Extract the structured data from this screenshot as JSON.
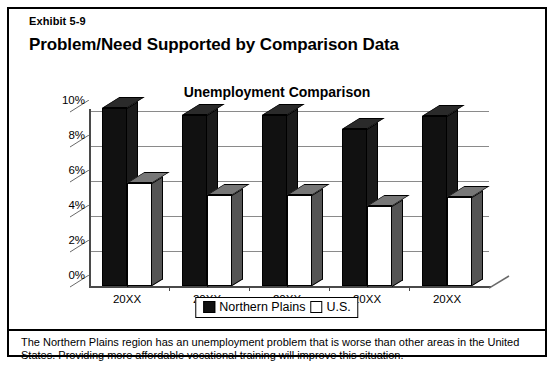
{
  "exhibit": {
    "label": "Exhibit 5-9"
  },
  "heading": {
    "title": "Problem/Need Supported by Comparison Data"
  },
  "legend": {
    "northern_plains": "Northern Plains",
    "us": "U.S."
  },
  "footer": {
    "text": "The Northern Plains region has an unemployment problem that is worse than other areas in the United States. Providing more affordable vocational training will improve this situation."
  },
  "chart_data": {
    "type": "bar",
    "title": "Unemployment Comparison",
    "xlabel": "",
    "ylabel": "",
    "ylim": [
      0,
      10
    ],
    "ytick_labels": [
      "10%",
      "8%",
      "6%",
      "4%",
      "2%",
      "0%"
    ],
    "ytick_values": [
      10,
      8,
      6,
      4,
      2,
      0
    ],
    "grid": true,
    "legend_position": "bottom-center",
    "style": "3d-clustered-column",
    "categories": [
      "20XX",
      "20XX",
      "20XX",
      "20XX",
      "20XX"
    ],
    "series": [
      {
        "name": "Northern Plains",
        "color": "#111111",
        "values": [
          10.2,
          9.8,
          9.8,
          9.0,
          9.7
        ]
      },
      {
        "name": "U.S.",
        "color": "#ffffff",
        "values": [
          5.9,
          5.2,
          5.2,
          4.6,
          5.1
        ]
      }
    ]
  }
}
